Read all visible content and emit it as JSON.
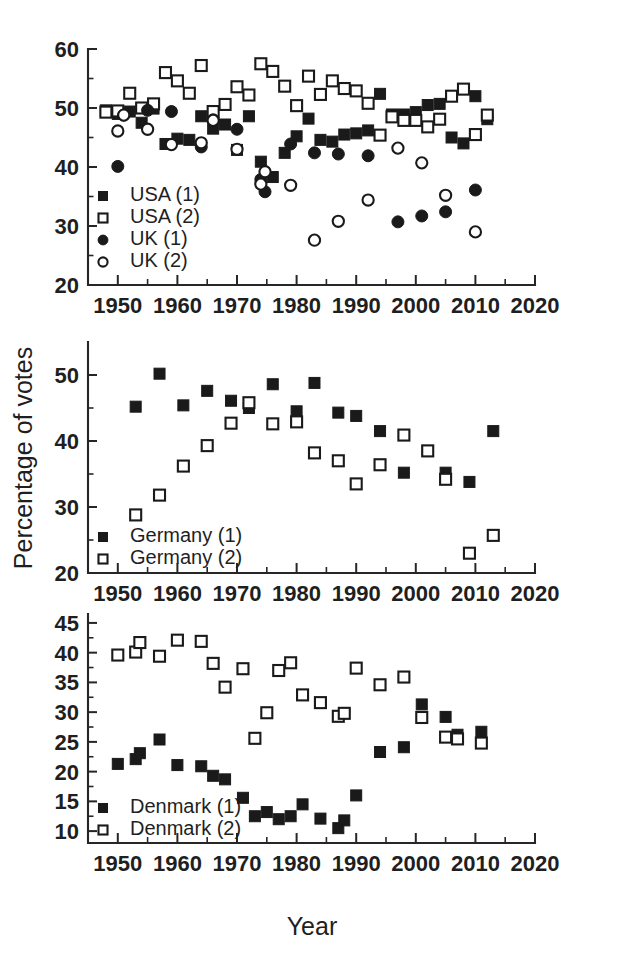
{
  "figure": {
    "xlabel": "Year",
    "ylabel": "Percentage of votes",
    "colors": {
      "ink": "#1a1a1a",
      "background": "#ffffff"
    }
  },
  "chart_data": [
    {
      "id": "panel-top",
      "type": "scatter",
      "title": "",
      "xlabel": "",
      "ylabel": "",
      "xlim": [
        1945,
        2020
      ],
      "ylim": [
        20,
        60
      ],
      "xticks": [
        1950,
        1960,
        1970,
        1980,
        1990,
        2000,
        2010,
        2020
      ],
      "yticks": [
        20,
        30,
        40,
        50,
        60
      ],
      "xminor_step": 5,
      "yminor_step": 5,
      "grid": false,
      "legend_position": "lower-left",
      "series": [
        {
          "name": "USA (1)",
          "marker": "filled-square",
          "points": [
            [
              1948,
              49.6
            ],
            [
              1950,
              49.0
            ],
            [
              1952,
              49.4
            ],
            [
              1954,
              47.5
            ],
            [
              1956,
              49.9
            ],
            [
              1958,
              43.9
            ],
            [
              1960,
              44.8
            ],
            [
              1962,
              44.6
            ],
            [
              1964,
              48.6
            ],
            [
              1966,
              46.5
            ],
            [
              1968,
              47.2
            ],
            [
              1970,
              42.9
            ],
            [
              1972,
              48.6
            ],
            [
              1974,
              40.9
            ],
            [
              1976,
              38.3
            ],
            [
              1978,
              42.4
            ],
            [
              1980,
              45.2
            ],
            [
              1982,
              48.2
            ],
            [
              1984,
              44.6
            ],
            [
              1986,
              44.3
            ],
            [
              1988,
              45.5
            ],
            [
              1990,
              45.7
            ],
            [
              1992,
              46.2
            ],
            [
              1994,
              52.4
            ],
            [
              1996,
              48.9
            ],
            [
              1998,
              48.9
            ],
            [
              2000,
              49.3
            ],
            [
              2002,
              50.5
            ],
            [
              2004,
              50.7
            ],
            [
              2006,
              45.0
            ],
            [
              2008,
              44.0
            ],
            [
              2010,
              52.0
            ],
            [
              2012,
              48.1
            ]
          ]
        },
        {
          "name": "USA (2)",
          "marker": "open-square",
          "points": [
            [
              1948,
              49.3
            ],
            [
              1950,
              49.5
            ],
            [
              1952,
              52.5
            ],
            [
              1954,
              50.0
            ],
            [
              1956,
              50.7
            ],
            [
              1958,
              56.0
            ],
            [
              1960,
              54.6
            ],
            [
              1962,
              52.5
            ],
            [
              1964,
              57.2
            ],
            [
              1966,
              49.4
            ],
            [
              1968,
              50.6
            ],
            [
              1970,
              53.6
            ],
            [
              1972,
              52.2
            ],
            [
              1974,
              57.5
            ],
            [
              1976,
              56.2
            ],
            [
              1978,
              53.7
            ],
            [
              1980,
              50.4
            ],
            [
              1982,
              55.4
            ],
            [
              1984,
              52.3
            ],
            [
              1986,
              54.6
            ],
            [
              1988,
              53.3
            ],
            [
              1990,
              52.9
            ],
            [
              1992,
              50.8
            ],
            [
              1994,
              45.4
            ],
            [
              1996,
              48.5
            ],
            [
              1998,
              47.9
            ],
            [
              2000,
              47.9
            ],
            [
              2002,
              46.8
            ],
            [
              2004,
              48.1
            ],
            [
              2006,
              52.0
            ],
            [
              2008,
              53.2
            ],
            [
              2010,
              45.5
            ],
            [
              2012,
              48.8
            ]
          ]
        },
        {
          "name": "UK (1)",
          "marker": "filled-circle",
          "points": [
            [
              1950,
              40.1
            ],
            [
              1951,
              48.8
            ],
            [
              1955,
              49.6
            ],
            [
              1959,
              49.4
            ],
            [
              1964,
              43.4
            ],
            [
              1966,
              48.0
            ],
            [
              1970,
              46.4
            ],
            [
              1974,
              37.9
            ],
            [
              1974.7,
              35.8
            ],
            [
              1979,
              43.9
            ],
            [
              1983,
              42.4
            ],
            [
              1987,
              42.2
            ],
            [
              1992,
              41.9
            ],
            [
              1997,
              30.7
            ],
            [
              2001,
              31.7
            ],
            [
              2005,
              32.4
            ],
            [
              2010,
              36.1
            ]
          ]
        },
        {
          "name": "UK (2)",
          "marker": "open-circle",
          "points": [
            [
              1950,
              46.1
            ],
            [
              1951,
              48.8
            ],
            [
              1955,
              46.4
            ],
            [
              1959,
              43.8
            ],
            [
              1964,
              44.1
            ],
            [
              1966,
              47.9
            ],
            [
              1970,
              43.0
            ],
            [
              1974,
              37.1
            ],
            [
              1974.7,
              39.2
            ],
            [
              1979,
              36.9
            ],
            [
              1983,
              27.6
            ],
            [
              1987,
              30.8
            ],
            [
              1992,
              34.4
            ],
            [
              1997,
              43.2
            ],
            [
              2001,
              40.7
            ],
            [
              2005,
              35.2
            ],
            [
              2010,
              29.0
            ]
          ]
        }
      ]
    },
    {
      "id": "panel-middle",
      "type": "scatter",
      "title": "",
      "xlabel": "",
      "ylabel": "Percentage of votes",
      "xlim": [
        1945,
        2020
      ],
      "ylim": [
        20,
        55
      ],
      "xticks": [
        1950,
        1960,
        1970,
        1980,
        1990,
        2000,
        2010,
        2020
      ],
      "yticks": [
        20,
        30,
        40,
        50
      ],
      "xminor_step": 5,
      "yminor_step": 5,
      "grid": false,
      "legend_position": "lower-left",
      "series": [
        {
          "name": "Germany (1)",
          "marker": "filled-square",
          "points": [
            [
              1953,
              45.2
            ],
            [
              1957,
              50.2
            ],
            [
              1961,
              45.4
            ],
            [
              1965,
              47.6
            ],
            [
              1969,
              46.1
            ],
            [
              1972,
              45.0
            ],
            [
              1976,
              48.6
            ],
            [
              1980,
              44.5
            ],
            [
              1983,
              48.8
            ],
            [
              1987,
              44.3
            ],
            [
              1990,
              43.8
            ],
            [
              1994,
              41.5
            ],
            [
              1998,
              35.2
            ],
            [
              2002,
              38.5
            ],
            [
              2005,
              35.2
            ],
            [
              2009,
              33.8
            ],
            [
              2013,
              41.5
            ]
          ]
        },
        {
          "name": "Germany (2)",
          "marker": "open-square",
          "points": [
            [
              1953,
              28.8
            ],
            [
              1957,
              31.8
            ],
            [
              1961,
              36.2
            ],
            [
              1965,
              39.3
            ],
            [
              1969,
              42.7
            ],
            [
              1972,
              45.8
            ],
            [
              1976,
              42.6
            ],
            [
              1980,
              42.9
            ],
            [
              1983,
              38.2
            ],
            [
              1987,
              37.0
            ],
            [
              1990,
              33.5
            ],
            [
              1994,
              36.4
            ],
            [
              1998,
              40.9
            ],
            [
              2002,
              38.5
            ],
            [
              2005,
              34.2
            ],
            [
              2009,
              23.0
            ],
            [
              2013,
              25.7
            ]
          ]
        }
      ]
    },
    {
      "id": "panel-bottom",
      "type": "scatter",
      "title": "",
      "xlabel": "Year",
      "ylabel": "",
      "xlim": [
        1945,
        2020
      ],
      "ylim": [
        8,
        45
      ],
      "xticks": [
        1950,
        1960,
        1970,
        1980,
        1990,
        2000,
        2010,
        2020
      ],
      "yticks": [
        10,
        15,
        20,
        25,
        30,
        35,
        40,
        45
      ],
      "xminor_step": 5,
      "yminor_step": 2.5,
      "grid": false,
      "legend_position": "lower-left",
      "series": [
        {
          "name": "Denmark (1)",
          "marker": "filled-square",
          "points": [
            [
              1950,
              21.3
            ],
            [
              1953,
              22.1
            ],
            [
              1953.7,
              23.1
            ],
            [
              1957,
              25.4
            ],
            [
              1960,
              21.1
            ],
            [
              1964,
              20.9
            ],
            [
              1966,
              19.3
            ],
            [
              1968,
              18.7
            ],
            [
              1971,
              15.6
            ],
            [
              1973,
              12.5
            ],
            [
              1975,
              13.2
            ],
            [
              1977,
              12.0
            ],
            [
              1979,
              12.5
            ],
            [
              1981,
              14.5
            ],
            [
              1984,
              12.1
            ],
            [
              1987,
              10.5
            ],
            [
              1988,
              11.8
            ],
            [
              1990,
              16.0
            ],
            [
              1994,
              23.3
            ],
            [
              1998,
              24.1
            ],
            [
              2001,
              31.3
            ],
            [
              2005,
              29.2
            ],
            [
              2007,
              26.2
            ],
            [
              2011,
              26.7
            ]
          ]
        },
        {
          "name": "Denmark (2)",
          "marker": "open-square",
          "points": [
            [
              1950,
              39.6
            ],
            [
              1953,
              40.1
            ],
            [
              1953.7,
              41.7
            ],
            [
              1957,
              39.4
            ],
            [
              1960,
              42.1
            ],
            [
              1964,
              41.9
            ],
            [
              1966,
              38.2
            ],
            [
              1968,
              34.2
            ],
            [
              1971,
              37.3
            ],
            [
              1973,
              25.6
            ],
            [
              1975,
              29.9
            ],
            [
              1977,
              37.0
            ],
            [
              1979,
              38.3
            ],
            [
              1981,
              32.9
            ],
            [
              1984,
              31.6
            ],
            [
              1987,
              29.3
            ],
            [
              1988,
              29.8
            ],
            [
              1990,
              37.4
            ],
            [
              1994,
              34.6
            ],
            [
              1998,
              35.9
            ],
            [
              2001,
              29.1
            ],
            [
              2005,
              25.8
            ],
            [
              2007,
              25.5
            ],
            [
              2011,
              24.8
            ]
          ]
        }
      ]
    }
  ],
  "legends": [
    {
      "panel": "panel-top",
      "entries": [
        {
          "label": "USA (1)",
          "marker": "filled-square"
        },
        {
          "label": "USA (2)",
          "marker": "open-square"
        },
        {
          "label": "UK (1)",
          "marker": "filled-circle"
        },
        {
          "label": "UK (2)",
          "marker": "open-circle"
        }
      ]
    },
    {
      "panel": "panel-middle",
      "entries": [
        {
          "label": "Germany (1)",
          "marker": "filled-square"
        },
        {
          "label": "Germany (2)",
          "marker": "open-square"
        }
      ]
    },
    {
      "panel": "panel-bottom",
      "entries": [
        {
          "label": "Denmark (1)",
          "marker": "filled-square"
        },
        {
          "label": "Denmark (2)",
          "marker": "open-square"
        }
      ]
    }
  ],
  "tick_labels": {
    "x": [
      "1950",
      "1960",
      "1970",
      "1980",
      "1990",
      "2000",
      "2010",
      "2020"
    ],
    "y_top": [
      "20",
      "30",
      "40",
      "50",
      "60"
    ],
    "y_middle": [
      "20",
      "30",
      "40",
      "50"
    ],
    "y_bottom": [
      "10",
      "15",
      "20",
      "25",
      "30",
      "35",
      "40",
      "45"
    ]
  }
}
